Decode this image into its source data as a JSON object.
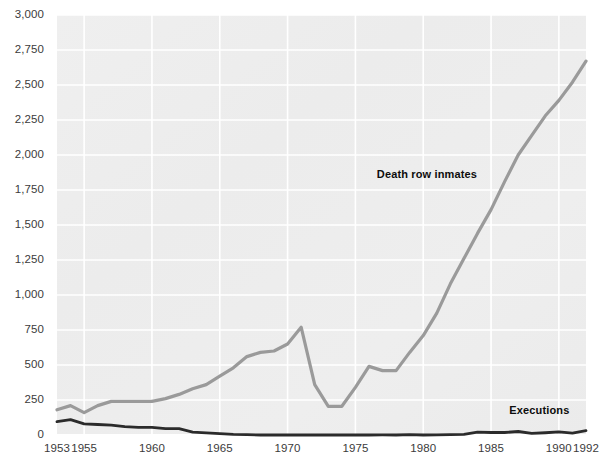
{
  "chart_data": {
    "type": "line",
    "title": "",
    "subtitle": "",
    "xlabel": "",
    "ylabel": "",
    "xlim": [
      1953,
      1992
    ],
    "ylim": [
      0,
      3000
    ],
    "grid": true,
    "legend_position": "inline-annotation",
    "x_tick_labels": [
      "1953",
      "1955",
      "1960",
      "1965",
      "1970",
      "1975",
      "1980",
      "1985",
      "1990",
      "1992"
    ],
    "x_tick_values": [
      1953,
      1955,
      1960,
      1965,
      1970,
      1975,
      1980,
      1985,
      1990,
      1992
    ],
    "y_tick_labels": [
      "0",
      "250",
      "500",
      "750",
      "1,000",
      "1,250",
      "1,500",
      "1,750",
      "2,000",
      "2,250",
      "2,500",
      "2,750",
      "3,000"
    ],
    "y_tick_values": [
      0,
      250,
      500,
      750,
      1000,
      1250,
      1500,
      1750,
      2000,
      2250,
      2500,
      2750,
      3000
    ],
    "x": [
      1953,
      1954,
      1955,
      1956,
      1957,
      1958,
      1959,
      1960,
      1961,
      1962,
      1963,
      1964,
      1965,
      1966,
      1967,
      1968,
      1969,
      1970,
      1971,
      1972,
      1973,
      1974,
      1975,
      1976,
      1977,
      1978,
      1979,
      1980,
      1981,
      1982,
      1983,
      1984,
      1985,
      1986,
      1987,
      1988,
      1989,
      1990,
      1991,
      1992
    ],
    "series": [
      {
        "name": "Death row inmates",
        "color": "#9a9a9a",
        "label_x": 1981,
        "label_y": 1860,
        "values": [
          180,
          210,
          160,
          210,
          240,
          240,
          240,
          240,
          260,
          290,
          330,
          360,
          420,
          480,
          560,
          590,
          600,
          650,
          770,
          360,
          205,
          205,
          340,
          490,
          460,
          460,
          590,
          710,
          870,
          1080,
          1260,
          1440,
          1610,
          1810,
          2000,
          2140,
          2280,
          2390,
          2520,
          2670
        ]
      },
      {
        "name": "Executions",
        "color": "#2b2b2b",
        "label_x": 1989,
        "label_y": 170,
        "values": [
          95,
          110,
          80,
          75,
          70,
          60,
          55,
          55,
          45,
          45,
          20,
          15,
          10,
          5,
          3,
          0,
          0,
          0,
          0,
          0,
          0,
          0,
          0,
          0,
          1,
          0,
          2,
          0,
          1,
          2,
          5,
          21,
          18,
          18,
          25,
          11,
          16,
          23,
          14,
          31
        ]
      }
    ],
    "annotations": [
      {
        "text": "Death row inmates",
        "x": 1981,
        "y": 1860
      },
      {
        "text": "Executions",
        "x": 1989,
        "y": 170
      }
    ],
    "style": {
      "plot_background": "#ededed",
      "gridline_color": "#ffffff",
      "page_background": "#ffffff",
      "tick_text_color": "#3b3b3b",
      "annotation_text_color": "#0d0d0d"
    }
  }
}
